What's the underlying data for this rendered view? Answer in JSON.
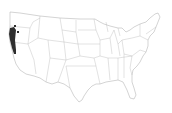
{
  "map": {
    "type": "us-state-outline-range-map",
    "region": "Contiguous United States",
    "colors": {
      "background": "#ffffff",
      "state_fill": "#ffffff",
      "state_border": "#a8a8a8",
      "range_fill": "#2e2e2e"
    },
    "highlighted_ranges": [
      {
        "name": "Pacific coast range",
        "location": "Northern California / Southern Oregon coast"
      },
      {
        "name": "Southern Oregon dot",
        "location": "Southwestern Oregon interior"
      }
    ]
  }
}
